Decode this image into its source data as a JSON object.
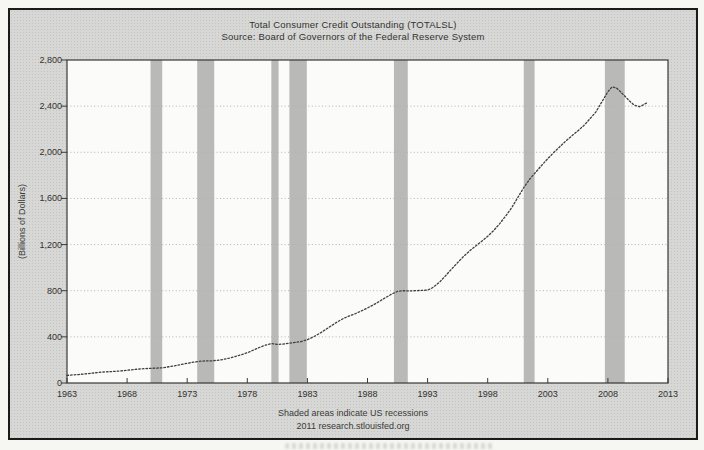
{
  "header": {
    "title": "Total Consumer Credit Outstanding (TOTALSL)",
    "source": "Source: Board of Governors of the Federal Reserve System"
  },
  "footer": {
    "note": "Shaded areas indicate US recessions",
    "attribution": "2011 research.stlouisfed.org"
  },
  "chart_data": {
    "type": "line",
    "title": "Total Consumer Credit Outstanding (TOTALSL)",
    "subtitle": "Source: Board of Governors of the Federal Reserve System",
    "xlabel": "",
    "ylabel": "(Billions of Dollars)",
    "xlim": [
      1963,
      2013
    ],
    "ylim": [
      0,
      2800
    ],
    "x_ticks": [
      1963,
      1968,
      1973,
      1978,
      1983,
      1988,
      1993,
      1998,
      2003,
      2008,
      2013
    ],
    "y_ticks": [
      0,
      400,
      800,
      1200,
      1600,
      2000,
      2400,
      2800
    ],
    "grid": "horizontal-dotted",
    "legend": "none",
    "series": [
      {
        "name": "TOTALSL",
        "points": [
          [
            1963.0,
            66
          ],
          [
            1963.5,
            70
          ],
          [
            1964.0,
            74
          ],
          [
            1964.5,
            79
          ],
          [
            1965.0,
            84
          ],
          [
            1965.5,
            90
          ],
          [
            1966.0,
            95
          ],
          [
            1966.5,
            98
          ],
          [
            1967.0,
            101
          ],
          [
            1967.5,
            105
          ],
          [
            1968.0,
            110
          ],
          [
            1968.5,
            116
          ],
          [
            1969.0,
            121
          ],
          [
            1969.5,
            125
          ],
          [
            1970.0,
            127
          ],
          [
            1970.5,
            129
          ],
          [
            1971.0,
            133
          ],
          [
            1971.5,
            141
          ],
          [
            1972.0,
            150
          ],
          [
            1972.5,
            160
          ],
          [
            1973.0,
            171
          ],
          [
            1973.5,
            180
          ],
          [
            1974.0,
            188
          ],
          [
            1974.5,
            192
          ],
          [
            1975.0,
            192
          ],
          [
            1975.5,
            197
          ],
          [
            1976.0,
            205
          ],
          [
            1976.5,
            216
          ],
          [
            1977.0,
            230
          ],
          [
            1977.5,
            245
          ],
          [
            1978.0,
            262
          ],
          [
            1978.5,
            285
          ],
          [
            1979.0,
            308
          ],
          [
            1979.5,
            328
          ],
          [
            1980.0,
            342
          ],
          [
            1980.5,
            335
          ],
          [
            1981.0,
            338
          ],
          [
            1981.5,
            346
          ],
          [
            1982.0,
            352
          ],
          [
            1982.5,
            360
          ],
          [
            1983.0,
            375
          ],
          [
            1983.5,
            400
          ],
          [
            1984.0,
            428
          ],
          [
            1984.5,
            462
          ],
          [
            1985.0,
            497
          ],
          [
            1985.5,
            530
          ],
          [
            1986.0,
            560
          ],
          [
            1986.5,
            582
          ],
          [
            1987.0,
            602
          ],
          [
            1987.5,
            625
          ],
          [
            1988.0,
            650
          ],
          [
            1988.5,
            678
          ],
          [
            1989.0,
            708
          ],
          [
            1989.5,
            740
          ],
          [
            1990.0,
            770
          ],
          [
            1990.5,
            795
          ],
          [
            1991.0,
            800
          ],
          [
            1991.5,
            798
          ],
          [
            1992.0,
            800
          ],
          [
            1992.5,
            803
          ],
          [
            1993.0,
            805
          ],
          [
            1993.4,
            825
          ],
          [
            1994.0,
            875
          ],
          [
            1994.5,
            930
          ],
          [
            1995.0,
            988
          ],
          [
            1995.5,
            1045
          ],
          [
            1996.0,
            1098
          ],
          [
            1996.5,
            1145
          ],
          [
            1997.0,
            1188
          ],
          [
            1997.5,
            1228
          ],
          [
            1998.0,
            1272
          ],
          [
            1998.5,
            1322
          ],
          [
            1999.0,
            1382
          ],
          [
            1999.5,
            1448
          ],
          [
            2000.0,
            1520
          ],
          [
            2000.5,
            1608
          ],
          [
            2001.0,
            1695
          ],
          [
            2001.5,
            1768
          ],
          [
            2002.0,
            1828
          ],
          [
            2002.5,
            1888
          ],
          [
            2003.0,
            1945
          ],
          [
            2003.5,
            1998
          ],
          [
            2004.0,
            2048
          ],
          [
            2004.5,
            2098
          ],
          [
            2005.0,
            2142
          ],
          [
            2005.5,
            2185
          ],
          [
            2006.0,
            2232
          ],
          [
            2006.5,
            2290
          ],
          [
            2007.0,
            2350
          ],
          [
            2007.5,
            2438
          ],
          [
            2008.0,
            2525
          ],
          [
            2008.35,
            2567
          ],
          [
            2008.7,
            2558
          ],
          [
            2009.0,
            2530
          ],
          [
            2009.4,
            2488
          ],
          [
            2009.8,
            2445
          ],
          [
            2010.2,
            2408
          ],
          [
            2010.6,
            2395
          ],
          [
            2010.9,
            2408
          ],
          [
            2011.1,
            2420
          ],
          [
            2011.3,
            2432
          ]
        ]
      }
    ],
    "recession_bands": [
      [
        1969.95,
        1970.92
      ],
      [
        1973.83,
        1975.25
      ],
      [
        1980.0,
        1980.6
      ],
      [
        1981.5,
        1982.95
      ],
      [
        1990.2,
        1991.35
      ],
      [
        2001.0,
        2001.9
      ],
      [
        2007.75,
        2009.4
      ]
    ],
    "footer_note": "Shaded areas indicate US recessions",
    "attribution": "2011 research.stlouisfed.org",
    "colors": {
      "line": "#3f3f3d",
      "recession_band": "#b9b9b7",
      "figure_bg": "#d7d7d5",
      "plot_bg": "#fbfbf9",
      "frame": "#3a3a38",
      "grid": "#b2b2b0",
      "text": "#2e2e2e",
      "border": "#1b1b1b"
    }
  }
}
